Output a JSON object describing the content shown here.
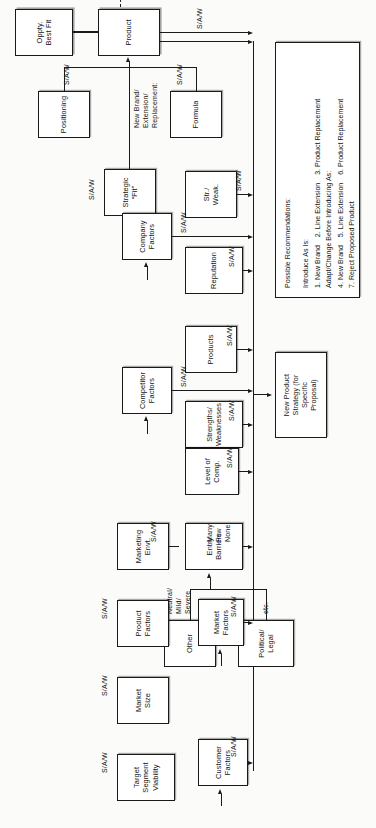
{
  "diagram": {
    "orientation": "rotated-90",
    "edge_labels": {
      "saw": "S/A/W",
      "many_few_none": "Many\nFew\nNone",
      "neutral_mild_severe": "Neutral/\nMild/\nSevere",
      "etc": "etc."
    },
    "nodes": {
      "strategic_fit": "Strategic\n“Fit”",
      "positioning": "Positioning",
      "formula": "Formula",
      "product": "Product",
      "oppty_best_fit": "Oppty.\nBest Fit",
      "str_weak": "Str./\nWeak.",
      "reputation": "Reputation",
      "company_factors": "Company\nFactors",
      "products": "Products",
      "strengths_weaknesses": "Strengths/\nWeaknesses",
      "competitor_factors": "Competitor\nFactors",
      "level_of_comp": "Level of\nComp.",
      "entry_barriers": "Entry\nBarriers",
      "other": "Other",
      "political_legal": "Political/\nLegal",
      "marketing_envt": "Marketing\nEnvt.",
      "product_factors": "Product\nFactors",
      "market_size": "Market\nSize",
      "target_segment_viability": "Target\nSegment\nViability",
      "market_factors": "Market\nFactors",
      "customer_factors": "Customer\nFactors",
      "new_product_strategy": "New Product\nStrategy (for\nSpecific\nProposal)"
    },
    "annotations": {
      "new_brand_extension_replacement": "New Brand/\nExtension/\nReplacement:"
    },
    "recommendations": {
      "heading": "Possible Recommendations:",
      "group1_heading": "Introduce As Is:",
      "group1_items": "1. New Brand    2. Line Extension    3. Product Replacement",
      "group2_heading": "Adapt/Change Before Introducing As:",
      "group2_items": "4. New Brand    5. Line Extension    6. Product Replacement",
      "group3_items": "7. Reject Proposed Product"
    },
    "colors": {
      "ink": "#1a1a1a",
      "paper": "#fbfbf9",
      "box_fill": "#ffffff"
    }
  }
}
